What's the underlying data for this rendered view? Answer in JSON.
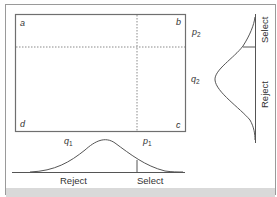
{
  "diagram": {
    "type": "selection-decision-diagram",
    "colors": {
      "frame": "#9a9a9a",
      "box": "#6f6f6f",
      "dotted": "#8a8a8a",
      "curve": "#555555",
      "text": "#333333",
      "bottom_band": "#d9d9d9"
    },
    "corners": {
      "a": "a",
      "b": "b",
      "c": "c",
      "d": "d"
    },
    "right_labels": {
      "p2": {
        "base": "p",
        "sub": "2"
      },
      "q2": {
        "base": "q",
        "sub": "2"
      }
    },
    "bottom_labels": {
      "q1": {
        "base": "q",
        "sub": "1"
      },
      "p1": {
        "base": "p",
        "sub": "1"
      }
    },
    "bottom_axis": {
      "reject_label": "Reject",
      "select_label": "Select"
    },
    "right_axis": {
      "select_label": "Select",
      "reject_label": "Reject"
    }
  }
}
